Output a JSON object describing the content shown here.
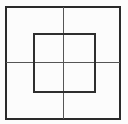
{
  "figure": {
    "canvas": {
      "width": 128,
      "height": 124,
      "background_color": "#fcfcfc"
    },
    "colors": {
      "outer_square_stroke": "#2a2a2a",
      "inner_square_stroke": "#2e2e2e",
      "cross_line_stroke": "#555555"
    },
    "shapes": {
      "outer_square": {
        "name": "outer-square",
        "x": 5.5,
        "y": 6.5,
        "width": 114,
        "height": 112,
        "stroke_width": 2,
        "fill": "none"
      },
      "inner_square": {
        "name": "inner-square",
        "x": 33.5,
        "y": 33.5,
        "width": 61,
        "height": 58,
        "stroke_width": 2,
        "fill": "none"
      },
      "vertical_line": {
        "name": "vertical-center-line",
        "x1": 63.5,
        "y1": 6.5,
        "x2": 63.5,
        "y2": 118.5,
        "stroke_width": 1.6
      },
      "horizontal_line": {
        "name": "horizontal-center-line",
        "x1": 5.5,
        "y1": 62.5,
        "x2": 119.5,
        "y2": 62.5,
        "stroke_width": 1.6
      }
    }
  }
}
